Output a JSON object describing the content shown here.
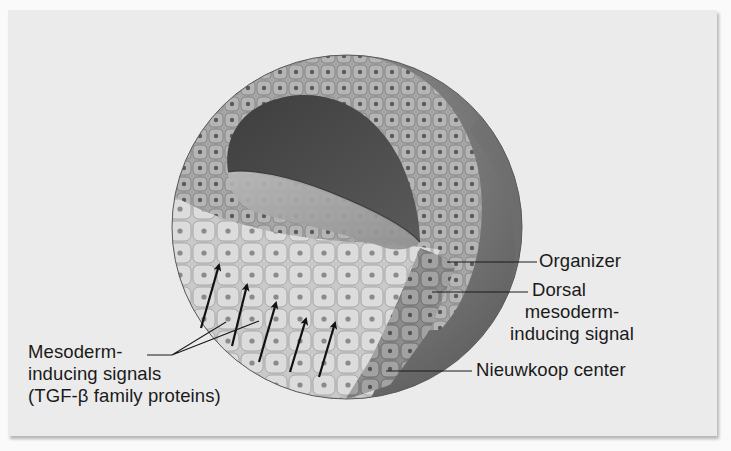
{
  "figure": {
    "background_color": "#ebebeb",
    "labels": {
      "mesoderm_inducing": {
        "line1": "Mesoderm-",
        "line2": "inducing signals",
        "line3": "(TGF-β family proteins)"
      },
      "organizer": "Organizer",
      "dorsal_signal": {
        "line1": "Dorsal",
        "line2": "mesoderm-",
        "line3": "inducing signal"
      },
      "nieuwkoop": "Nieuwkoop center"
    },
    "arrows_count": 5,
    "colors": {
      "animal_cells": "#a9a9a9",
      "vegetal_cells": "#d8d8d8",
      "outer_surface": "#7d7d7d",
      "cavity": "#4a4a4a",
      "nieuwkoop_region": "#8a8a8a",
      "text": "#1a1a1a"
    }
  }
}
